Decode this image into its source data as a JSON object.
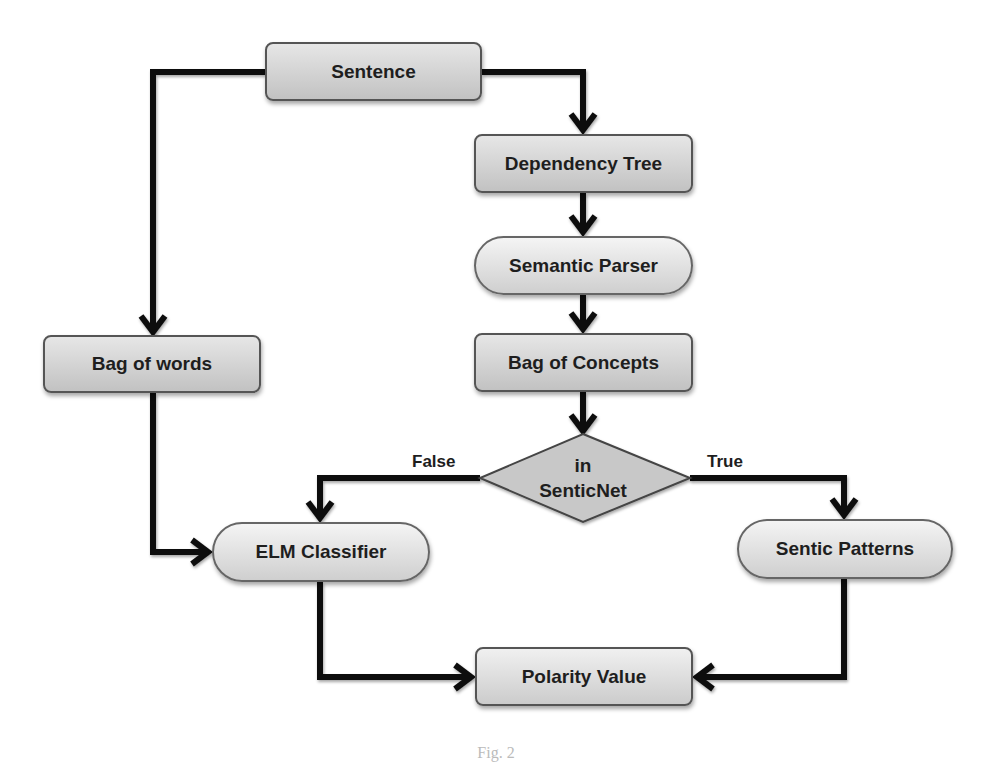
{
  "diagram": {
    "type": "flowchart",
    "nodes": {
      "sentence": "Sentence",
      "dependency_tree": "Dependency Tree",
      "semantic_parser": "Semantic Parser",
      "bag_of_words": "Bag of words",
      "bag_of_concepts": "Bag of Concepts",
      "decision_line1": "in",
      "decision_line2": "SenticNet",
      "elm_classifier": "ELM Classifier",
      "sentic_patterns": "Sentic Patterns",
      "polarity_value": "Polarity Value"
    },
    "edge_labels": {
      "false": "False",
      "true": "True"
    },
    "edges": [
      {
        "from": "Sentence",
        "to": "Bag of words"
      },
      {
        "from": "Sentence",
        "to": "Dependency Tree"
      },
      {
        "from": "Dependency Tree",
        "to": "Semantic Parser"
      },
      {
        "from": "Semantic Parser",
        "to": "Bag of Concepts"
      },
      {
        "from": "Bag of Concepts",
        "to": "in SenticNet"
      },
      {
        "from": "in SenticNet",
        "to": "ELM Classifier",
        "label": "False"
      },
      {
        "from": "in SenticNet",
        "to": "Sentic Patterns",
        "label": "True"
      },
      {
        "from": "Bag of words",
        "to": "ELM Classifier"
      },
      {
        "from": "ELM Classifier",
        "to": "Polarity Value"
      },
      {
        "from": "Sentic Patterns",
        "to": "Polarity Value"
      }
    ],
    "colors": {
      "node_fill_top": "#e6e6e6",
      "node_fill_bottom": "#c2c2c2",
      "diamond_fill": "#c8c8c8",
      "edge": "#111111",
      "text": "#1e1e1e"
    }
  },
  "caption": "Fig. 2"
}
